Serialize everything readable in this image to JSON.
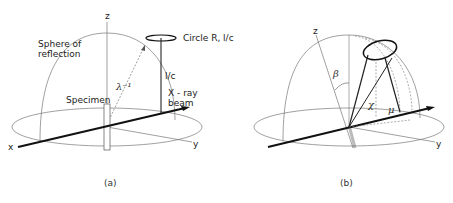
{
  "panel_a": {
    "caption": "(a)",
    "axis_z": "z",
    "axis_x": "x",
    "axis_y": "y",
    "sphere_label_line1": "Sphere of",
    "sphere_label_line2": "reflection",
    "circle_label": "Circle  R, l/c",
    "height_label": "l/c",
    "radius_label": "λ⁻¹",
    "specimen_label": "Specimen",
    "beam_label_line1": "X - ray",
    "beam_label_line2": "beam"
  },
  "panel_b": {
    "caption": "(b)",
    "axis_z": "z",
    "axis_y": "y",
    "angle_beta": "β",
    "angle_chi": "χ",
    "angle_mu": "μ"
  }
}
